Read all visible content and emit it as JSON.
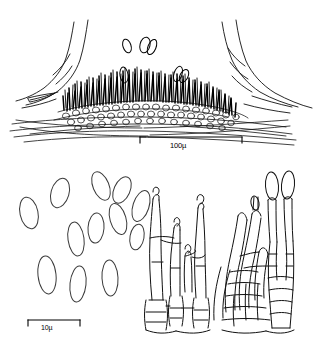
{
  "figure": {
    "background_color": "#ffffff",
    "ink_color": "#000000",
    "width": 319,
    "height": 343
  },
  "scale_bars": {
    "top": {
      "label": "100µ",
      "value": 100,
      "unit": "µ",
      "x_start": 140,
      "x_end": 242,
      "y": 137
    },
    "bottom": {
      "label": "10µ",
      "value": 10,
      "unit": "µ",
      "x_start": 28,
      "x_end": 80,
      "y": 320
    }
  },
  "panels": {
    "top": {
      "name": "acervulus-cross-section",
      "description": "Cross-section of an acervulus erupting through host tissue, showing a dense palisade of dark conidiophores over a pseudoparenchymatous stromatic base, with ruptured host epidermal flaps at left and right and free conidia above"
    },
    "bottom_left": {
      "name": "conidia-panel",
      "description": "Free conidia, ellipsoid to fusiform, drawn in outline",
      "conidia_count": 15
    },
    "bottom_middle": {
      "name": "conidiophore-cluster-left",
      "description": "Branched septate conidiophores with dark-tipped phialides arising from basal cells"
    },
    "bottom_right": {
      "name": "conidiophore-cluster-right",
      "description": "Branched septate conidiophores bearing attached elongate conidia at the apices"
    }
  },
  "drawing": {
    "conidia": [
      {
        "cx": 29,
        "cy": 213,
        "rx": 9,
        "ry": 16,
        "rot": -12
      },
      {
        "cx": 60,
        "cy": 193,
        "rx": 9,
        "ry": 15,
        "rot": 16
      },
      {
        "cx": 76,
        "cy": 239,
        "rx": 8,
        "ry": 17,
        "rot": -8
      },
      {
        "cx": 101,
        "cy": 186,
        "rx": 8,
        "ry": 15,
        "rot": -22
      },
      {
        "cx": 122,
        "cy": 190,
        "rx": 8,
        "ry": 14,
        "rot": 24
      },
      {
        "cx": 96,
        "cy": 228,
        "rx": 8,
        "ry": 15,
        "rot": 4
      },
      {
        "cx": 118,
        "cy": 219,
        "rx": 8,
        "ry": 16,
        "rot": -16
      },
      {
        "cx": 141,
        "cy": 206,
        "rx": 8,
        "ry": 16,
        "rot": 18
      },
      {
        "cx": 47,
        "cy": 275,
        "rx": 9,
        "ry": 19,
        "rot": -6
      },
      {
        "cx": 78,
        "cy": 284,
        "rx": 8,
        "ry": 18,
        "rot": 6
      },
      {
        "cx": 110,
        "cy": 278,
        "rx": 8,
        "ry": 18,
        "rot": -3
      },
      {
        "cx": 137,
        "cy": 237,
        "rx": 7,
        "ry": 13,
        "rot": 10
      }
    ],
    "free_conidia_top": [
      {
        "cx": 127,
        "cy": 46,
        "rx": 4,
        "ry": 7,
        "rot": -18
      },
      {
        "cx": 145,
        "cy": 45,
        "rx": 5,
        "ry": 8,
        "rot": 14
      },
      {
        "cx": 152,
        "cy": 47,
        "rx": 4,
        "ry": 8,
        "rot": 22
      },
      {
        "cx": 124,
        "cy": 75,
        "rx": 4,
        "ry": 8,
        "rot": -8
      },
      {
        "cx": 178,
        "cy": 74,
        "rx": 4,
        "ry": 8,
        "rot": 18
      },
      {
        "cx": 184,
        "cy": 76,
        "rx": 4,
        "ry": 7,
        "rot": 26
      }
    ]
  }
}
